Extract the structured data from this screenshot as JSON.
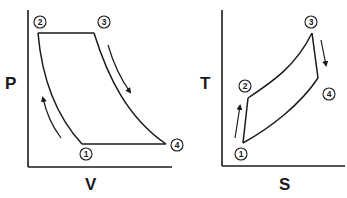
{
  "diagrams": [
    {
      "id": "pv",
      "axes": {
        "y_label": "P",
        "x_label": "V"
      },
      "points": [
        {
          "label": "1",
          "x": 82,
          "y": 144,
          "label_x": 86,
          "label_y": 154
        },
        {
          "label": "2",
          "x": 38,
          "y": 33,
          "label_x": 40,
          "label_y": 22
        },
        {
          "label": "3",
          "x": 94,
          "y": 33,
          "label_x": 104,
          "label_y": 22
        },
        {
          "label": "4",
          "x": 166,
          "y": 144,
          "label_x": 177,
          "label_y": 145
        }
      ],
      "processes": [
        {
          "from": "1",
          "to": "2",
          "type": "compression curve"
        },
        {
          "from": "2",
          "to": "3",
          "type": "constant pressure"
        },
        {
          "from": "3",
          "to": "4",
          "type": "expansion curve"
        },
        {
          "from": "4",
          "to": "1",
          "type": "constant pressure"
        }
      ],
      "arrows": [
        "1 to 2 (upward)",
        "3 to 4 (downward)"
      ]
    },
    {
      "id": "ts",
      "axes": {
        "y_label": "T",
        "x_label": "S"
      },
      "points": [
        {
          "label": "1",
          "x": 243,
          "y": 143,
          "label_x": 243,
          "label_y": 154
        },
        {
          "label": "2",
          "x": 248,
          "y": 98,
          "label_x": 245,
          "label_y": 86
        },
        {
          "label": "3",
          "x": 312,
          "y": 33,
          "label_x": 311,
          "label_y": 22
        },
        {
          "label": "4",
          "x": 318,
          "y": 78,
          "label_x": 329,
          "label_y": 94
        }
      ],
      "processes": [
        {
          "from": "1",
          "to": "2",
          "type": "near-isentropic"
        },
        {
          "from": "2",
          "to": "3",
          "type": "heat addition curve"
        },
        {
          "from": "3",
          "to": "4",
          "type": "near-isentropic"
        },
        {
          "from": "4",
          "to": "1",
          "type": "heat rejection curve"
        }
      ],
      "arrows": [
        "1 to 2 (upward)",
        "3 to 4 (downward)"
      ]
    }
  ]
}
